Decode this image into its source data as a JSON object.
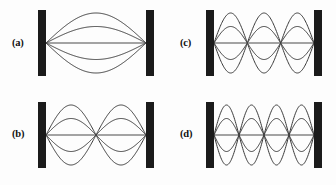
{
  "figure": {
    "background_color": "#fdfdfd",
    "wall_color": "#1b1b1b",
    "curve_color": "#3a3a3a",
    "axis_color": "#4a4a4a",
    "width": 336,
    "height": 185
  },
  "chart_data": {
    "type": "line",
    "xlabel": "",
    "ylabel": "",
    "grid": false,
    "legend": "none",
    "panels": [
      {
        "label": "(a)",
        "harmonic": 1,
        "loops": 1,
        "curve_count": 5,
        "amplitude_fractions": [
          1.0,
          0.55,
          0.0,
          -0.55,
          -1.0
        ],
        "node_positions": [
          0.0,
          1.0
        ],
        "antinode_positions": [
          0.5
        ]
      },
      {
        "label": "(b)",
        "harmonic": 2,
        "loops": 2,
        "curve_count": 5,
        "amplitude_fractions": [
          1.0,
          0.55,
          0.0,
          -0.55,
          -1.0
        ],
        "node_positions": [
          0.0,
          0.5,
          1.0
        ],
        "antinode_positions": [
          0.25,
          0.75
        ]
      },
      {
        "label": "(c)",
        "harmonic": 3,
        "loops": 3,
        "curve_count": 5,
        "amplitude_fractions": [
          1.0,
          0.55,
          0.0,
          -0.55,
          -1.0
        ],
        "node_positions": [
          0.0,
          0.3333,
          0.6667,
          1.0
        ],
        "antinode_positions": [
          0.1667,
          0.5,
          0.8333
        ]
      },
      {
        "label": "(d)",
        "harmonic": 4,
        "loops": 4,
        "curve_count": 5,
        "amplitude_fractions": [
          1.0,
          0.55,
          0.0,
          -0.55,
          -1.0
        ],
        "node_positions": [
          0.0,
          0.25,
          0.5,
          0.75,
          1.0
        ],
        "antinode_positions": [
          0.125,
          0.375,
          0.625,
          0.875
        ]
      }
    ]
  },
  "panels": {
    "a": {
      "label": "(a)",
      "label_x": 12,
      "label_y": 37,
      "geometry": {
        "x": 34,
        "y": 8,
        "w": 126,
        "h": 76
      },
      "wall_left_x": 4,
      "wall_right_x": 112,
      "wall_width": 8,
      "wall_top": 2,
      "wall_height": 66,
      "string_y": 35,
      "span_left": 12,
      "span_right": 112,
      "loops": 1,
      "amplitude": 30
    },
    "b": {
      "label": "(b)",
      "label_x": 12,
      "label_y": 128,
      "geometry": {
        "x": 34,
        "y": 100,
        "w": 126,
        "h": 76
      },
      "wall_left_x": 4,
      "wall_right_x": 112,
      "wall_width": 8,
      "wall_top": 2,
      "wall_height": 66,
      "string_y": 35,
      "span_left": 12,
      "span_right": 112,
      "loops": 2,
      "amplitude": 30
    },
    "c": {
      "label": "(c)",
      "label_x": 180,
      "label_y": 37,
      "geometry": {
        "x": 202,
        "y": 8,
        "w": 126,
        "h": 76
      },
      "wall_left_x": 4,
      "wall_right_x": 112,
      "wall_width": 8,
      "wall_top": 2,
      "wall_height": 66,
      "string_y": 35,
      "span_left": 12,
      "span_right": 112,
      "loops": 3,
      "amplitude": 30
    },
    "d": {
      "label": "(d)",
      "label_x": 180,
      "label_y": 128,
      "geometry": {
        "x": 202,
        "y": 100,
        "w": 126,
        "h": 76
      },
      "wall_left_x": 4,
      "wall_right_x": 112,
      "wall_width": 8,
      "wall_top": 2,
      "wall_height": 66,
      "string_y": 35,
      "span_left": 12,
      "span_right": 112,
      "loops": 4,
      "amplitude": 30
    }
  }
}
